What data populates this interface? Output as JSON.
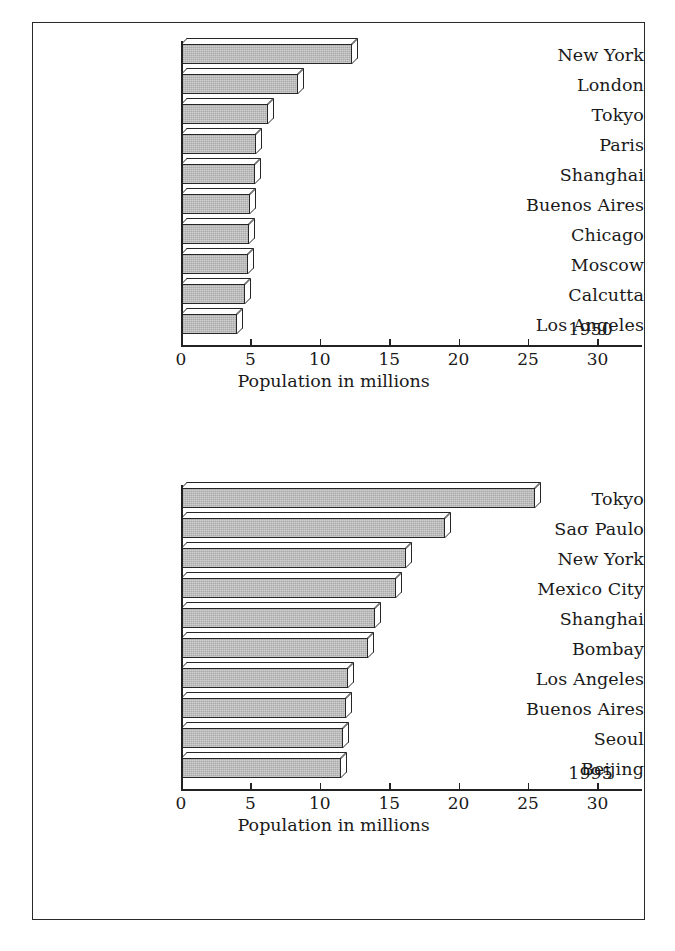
{
  "figure": {
    "axis_title": "Population in millions",
    "axis_ticks": [
      0,
      5,
      10,
      15,
      20,
      25,
      30
    ],
    "xmin": 0,
    "xmax": 32.2,
    "bar_fill_color": "#a9a9a9",
    "bar_edge_color": "#262626",
    "frame_color": "#2a2a2a",
    "background_color": "#ffffff"
  },
  "chart_data": [
    {
      "type": "bar",
      "orientation": "horizontal",
      "title": "",
      "annotation": "1950",
      "xlabel": "Population in millions",
      "ylabel": "",
      "xlim": [
        0,
        32.2
      ],
      "xticks": [
        0,
        5,
        10,
        15,
        20,
        25,
        30
      ],
      "grid": false,
      "legend": false,
      "categories": [
        "New York",
        "London",
        "Tokyo",
        "Paris",
        "Shanghai",
        "Buenos Aires",
        "Chicago",
        "Moscow",
        "Calcutta",
        "Los Angeles"
      ],
      "values": [
        12.3,
        8.4,
        6.3,
        5.4,
        5.3,
        5.0,
        4.9,
        4.8,
        4.6,
        4.0
      ]
    },
    {
      "type": "bar",
      "orientation": "horizontal",
      "title": "",
      "annotation": "1995",
      "xlabel": "Population in millions",
      "ylabel": "",
      "xlim": [
        0,
        32.2
      ],
      "xticks": [
        0,
        5,
        10,
        15,
        20,
        25,
        30
      ],
      "grid": false,
      "legend": false,
      "categories": [
        "Tokyo",
        "Saσ Paulo",
        "New York",
        "Mexico City",
        "Shanghai",
        "Bombay",
        "Los Angeles",
        "Buenos Aires",
        "Seoul",
        "Beijing"
      ],
      "values": [
        25.5,
        19.0,
        16.2,
        15.5,
        14.0,
        13.5,
        12.0,
        11.9,
        11.7,
        11.5
      ]
    }
  ]
}
